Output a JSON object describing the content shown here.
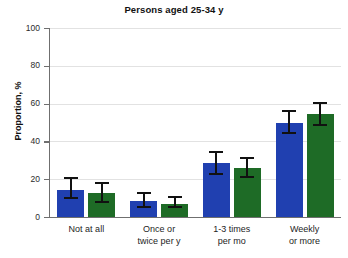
{
  "chart_data": {
    "type": "bar",
    "title": "Persons aged 25-34 y",
    "xlabel": "",
    "ylabel": "Proportion, %",
    "ylim": [
      0,
      100
    ],
    "yticks": [
      0,
      20,
      40,
      60,
      80,
      100
    ],
    "ytick_labels": [
      "0",
      "20",
      "40",
      "60",
      "80",
      "100"
    ],
    "grid": true,
    "grid_axis": "y",
    "legend": null,
    "categories": [
      "Not at all",
      "Once or\ntwice per y",
      "1-3 times\nper mo",
      "Weekly\nor more"
    ],
    "series": [
      {
        "name": "series-1",
        "color": "#2040b0",
        "values": [
          14.5,
          8.5,
          28.5,
          50.0
        ],
        "error_low": [
          9.5,
          5.0,
          22.0,
          44.0
        ],
        "error_high": [
          21.0,
          13.0,
          35.0,
          56.5
        ]
      },
      {
        "name": "series-2",
        "color": "#1e6b26",
        "values": [
          12.5,
          7.0,
          26.0,
          54.5
        ],
        "error_low": [
          7.5,
          4.5,
          20.5,
          48.0
        ],
        "error_high": [
          18.5,
          11.0,
          31.5,
          61.0
        ]
      }
    ],
    "colors": {
      "series_1": "#2040b0",
      "series_2": "#1e6b26",
      "grid": "#e2e2e2",
      "axis": "#6f6f6f",
      "error_bar": "#111111",
      "background": "#ffffff"
    }
  }
}
